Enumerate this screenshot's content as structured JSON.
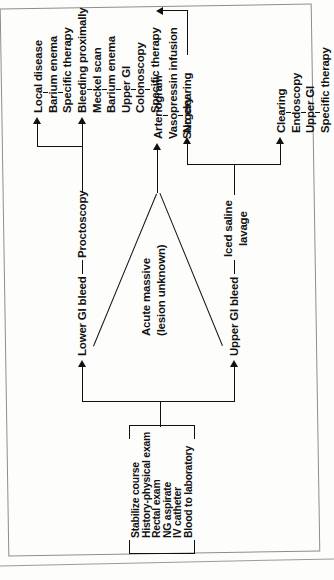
{
  "diagram": {
    "orientation": "rotated-90",
    "ink_color": "#111111",
    "frame_color": "#8d8d8d",
    "initial_box": {
      "name": "initial-assessment",
      "lines": [
        "Stabilize course",
        "History-physical exam",
        "Rectal exam",
        "NG aspirate",
        "IV catheter",
        "Blood to laboratory"
      ]
    },
    "branches": {
      "lower": {
        "label": "Lower GI bleed",
        "step": "Proctoscopy",
        "outcomes": [
          {
            "name": "local-disease",
            "lines": [
              "Local disease",
              "Barium enema",
              "Specific therapy"
            ]
          },
          {
            "name": "bleeding-proximally",
            "lines": [
              "Bleeding proximally",
              "Meckel scan",
              "Barium enema",
              "Upper GI",
              "Colonoscopy",
              "Specific therapy"
            ]
          }
        ]
      },
      "upper": {
        "label": "Upper GI bleed",
        "step_lines": [
          "Iced saline",
          "lavage"
        ],
        "outcomes": [
          {
            "name": "no-clearing",
            "lines": [
              "No clearing"
            ]
          },
          {
            "name": "clearing",
            "lines": [
              "Clearing",
              "Endoscopy",
              "Upper GI",
              "Specific therapy"
            ]
          }
        ]
      },
      "acute": {
        "name": "acute-massive",
        "lines": [
          "Acute massive",
          "(lesion unknown)"
        ],
        "outcome": {
          "name": "arteriogram",
          "lines": [
            "Arteriogram",
            "Vasopressin infusion",
            "Surgery"
          ]
        }
      }
    }
  }
}
